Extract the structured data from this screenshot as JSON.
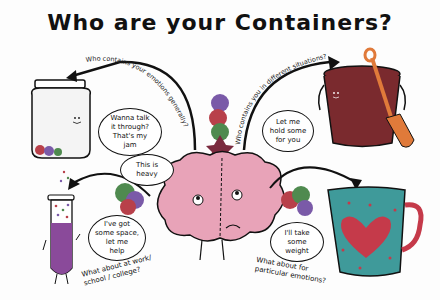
{
  "title": "Who are your Containers?",
  "colors": {
    "outline": "#111111",
    "brain": "#e8a3b8",
    "bucket": "#7a2a2e",
    "shovel": "#e07a3a",
    "tube_liquid": "#8a4a9a",
    "mug": "#3f9a9a",
    "heart": "#c53a4a",
    "blob_green": "#4f8a4f",
    "blob_red": "#b8404a",
    "blob_purple": "#7a5aa8"
  },
  "arrows": {
    "jar": "Who contains your emotions generally?",
    "bucket": "Who contains you in different situations?"
  },
  "bubbles": {
    "jar": "Wanna talk\nit through?\nThat's my\njam",
    "bucket": "Let me\nhold some\nfor you",
    "brain": "This is\nheavy",
    "tube": "I've got\nsome space,\nlet me\nhelp",
    "mug": "I'll take\nsome\nweight"
  },
  "captions": {
    "work": "What about at work/\nschool / college?",
    "emotions": "What about for\nparticular emotions?"
  },
  "characters": [
    "jar",
    "bucket-with-shovel",
    "brain",
    "test-tube",
    "mug"
  ]
}
